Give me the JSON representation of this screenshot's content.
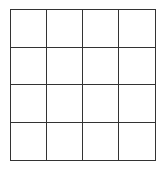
{
  "grid": {
    "rows": 4,
    "columns": 4,
    "line_color": "#333333",
    "background_color": "#ffffff",
    "cells": [
      [
        "",
        "",
        "",
        ""
      ],
      [
        "",
        "",
        "",
        ""
      ],
      [
        "",
        "",
        "",
        ""
      ],
      [
        "",
        "",
        "",
        ""
      ]
    ]
  }
}
